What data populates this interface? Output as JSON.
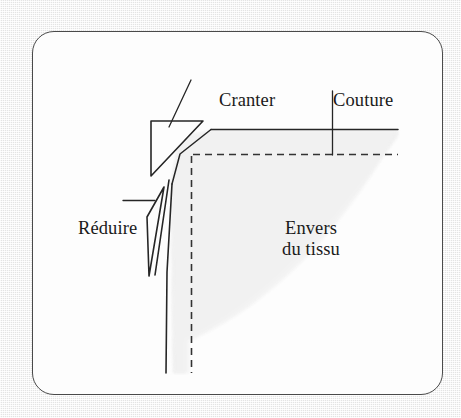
{
  "figure": {
    "kind": "sewing-technique-diagram",
    "language": "fr",
    "title_visible": false,
    "frame": {
      "style": "rounded-rectangle-border",
      "border_color": "#4a4a4a",
      "fill_color": "#fdfdfd",
      "page_background": "#ededed"
    },
    "labels": {
      "cranter": "Cranter",
      "couture": "Couture",
      "reduire": "Réduire",
      "envers_line1": "Envers",
      "envers_line2": "du tissu"
    },
    "annotations": [
      {
        "name": "cranter",
        "text": "Cranter",
        "leader": "diagonal",
        "points_to": "notch-triangle"
      },
      {
        "name": "couture",
        "text": "Couture",
        "leader": "vertical",
        "points_to": "seam-dashed-line"
      },
      {
        "name": "reduire",
        "text": "Réduire",
        "leader": "horizontal",
        "points_to": "trimmed-sliver"
      },
      {
        "name": "envers-du-tissu",
        "text": "Envers du tissu",
        "leader": "none",
        "points_to": "fabric-wrong-side-area"
      }
    ],
    "shapes": {
      "fabric_shade_color": "#f1f1f1",
      "ink_color": "#262626",
      "seam_line_style": "dashed",
      "edge_line_style": "solid"
    }
  }
}
